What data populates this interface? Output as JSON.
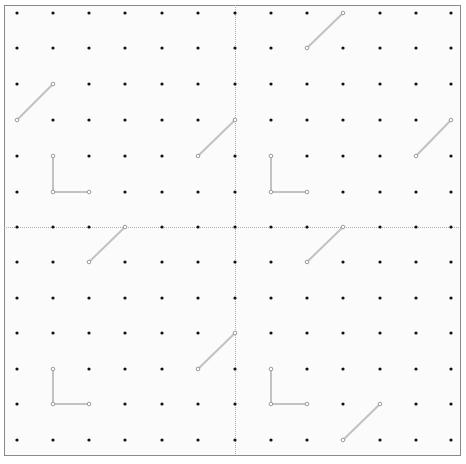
{
  "board": {
    "title": "Geoboard grid",
    "frame": {
      "x": 4,
      "y": 5,
      "width": 456,
      "height": 450
    },
    "columns_x": [
      17,
      53,
      89,
      125,
      162,
      198,
      235,
      271,
      307,
      343,
      380,
      416,
      451
    ],
    "rows_y": [
      13,
      48,
      84,
      120,
      156,
      192,
      227,
      262,
      298,
      333,
      369,
      404,
      440
    ],
    "dividers": {
      "vertical_x": 235,
      "horizontal_y": 227
    },
    "colors": {
      "background": "#fbfbfb",
      "frame": "#8a8a8a",
      "divider": "#b0b0b0",
      "dot": "#111111",
      "segment": "#c2c2c2",
      "endpoint": "#9a9a9a"
    },
    "quadrants": [
      {
        "name": "top-left",
        "segments": [
          {
            "points": [
              [
                1,
                2
              ],
              [
                0,
                3
              ]
            ]
          },
          {
            "points": [
              [
                1,
                4
              ],
              [
                1,
                5
              ],
              [
                2,
                5
              ]
            ]
          },
          {
            "points": [
              [
                5,
                4
              ],
              [
                6,
                3
              ]
            ]
          }
        ]
      },
      {
        "name": "top-right",
        "segments": [
          {
            "points": [
              [
                8,
                1
              ],
              [
                9,
                0
              ]
            ]
          },
          {
            "points": [
              [
                7,
                4
              ],
              [
                7,
                5
              ],
              [
                8,
                5
              ]
            ]
          },
          {
            "points": [
              [
                11,
                4
              ],
              [
                12,
                3
              ]
            ]
          }
        ]
      },
      {
        "name": "bottom-left",
        "segments": [
          {
            "points": [
              [
                2,
                7
              ],
              [
                3,
                6
              ]
            ]
          },
          {
            "points": [
              [
                5,
                10
              ],
              [
                6,
                9
              ]
            ]
          },
          {
            "points": [
              [
                1,
                10
              ],
              [
                1,
                11
              ],
              [
                2,
                11
              ]
            ]
          }
        ]
      },
      {
        "name": "bottom-right",
        "segments": [
          {
            "points": [
              [
                8,
                7
              ],
              [
                9,
                6
              ]
            ]
          },
          {
            "points": [
              [
                7,
                10
              ],
              [
                7,
                11
              ],
              [
                8,
                11
              ]
            ]
          },
          {
            "points": [
              [
                9,
                12
              ],
              [
                10,
                11
              ]
            ]
          }
        ]
      }
    ]
  }
}
